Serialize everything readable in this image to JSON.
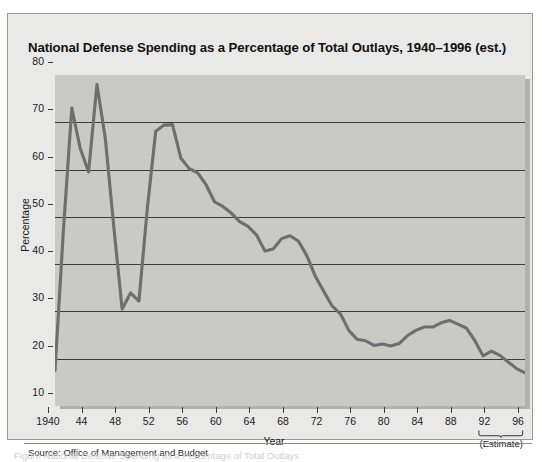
{
  "figure": {
    "title": "National Defense Spending as a Percentage of Total Outlays, 1940–1996 (est.)",
    "source": "Source: Office of Management and Budget",
    "estimate_note": "(Estimate)",
    "caption": "Figure  National Defense Spending as a Percentage of Total Outlays",
    "colors": {
      "page_background": "#ffffff",
      "panel_background": "#e9e9e7",
      "plot_background": "#c9c9c6",
      "plot_shadow": "#b0b0ad",
      "line": "#6e6e6e",
      "gridline": "#3a3a3a",
      "text": "#111111"
    }
  },
  "chart_data": {
    "type": "line",
    "title": "National Defense Spending as a Percentage of Total Outlays, 1940–1996 (est.)",
    "xlabel": "Year",
    "ylabel": "Percentage",
    "xlim": [
      1940,
      1996
    ],
    "ylim": [
      10,
      80
    ],
    "grid": true,
    "legend": null,
    "ytick_labels": [
      "80",
      "70",
      "60",
      "50",
      "40",
      "30",
      "20",
      "10"
    ],
    "ytick_values": [
      80,
      70,
      60,
      50,
      40,
      30,
      20,
      10
    ],
    "xtick_labels": [
      "1940",
      "44",
      "48",
      "52",
      "56",
      "60",
      "64",
      "68",
      "72",
      "76",
      "80",
      "84",
      "88",
      "92",
      "96"
    ],
    "xtick_values": [
      1940,
      1944,
      1948,
      1952,
      1956,
      1960,
      1964,
      1968,
      1972,
      1976,
      1980,
      1984,
      1988,
      1992,
      1996
    ],
    "annotations": [
      {
        "text": "(Estimate)",
        "x_range": [
          1992,
          1996
        ],
        "position": "below-axis"
      }
    ],
    "series": [
      {
        "name": "National defense spending (% of total outlays)",
        "x": [
          1940,
          1941,
          1942,
          1943,
          1944,
          1945,
          1946,
          1947,
          1948,
          1949,
          1950,
          1951,
          1952,
          1953,
          1954,
          1955,
          1956,
          1957,
          1958,
          1959,
          1960,
          1961,
          1962,
          1963,
          1964,
          1965,
          1966,
          1967,
          1968,
          1969,
          1970,
          1971,
          1972,
          1973,
          1974,
          1975,
          1976,
          1977,
          1978,
          1979,
          1980,
          1981,
          1982,
          1983,
          1984,
          1985,
          1986,
          1987,
          1988,
          1989,
          1990,
          1991,
          1992,
          1993,
          1994,
          1995,
          1996
        ],
        "y": [
          17.5,
          47.1,
          73.0,
          64.5,
          59.5,
          78.0,
          66.5,
          48.0,
          30.5,
          33.9,
          32.2,
          51.8,
          68.1,
          69.4,
          69.5,
          62.4,
          60.2,
          59.3,
          56.8,
          53.2,
          52.2,
          50.8,
          49.0,
          48.0,
          46.2,
          42.8,
          43.2,
          45.4,
          46.0,
          44.9,
          41.8,
          37.5,
          34.3,
          31.2,
          29.5,
          26.0,
          24.1,
          23.8,
          22.8,
          23.1,
          22.7,
          23.2,
          24.9,
          26.0,
          26.7,
          26.7,
          27.6,
          28.1,
          27.3,
          26.5,
          23.9,
          20.6,
          21.6,
          20.7,
          19.3,
          17.9,
          17.0
        ],
        "estimate_from": 1992
      }
    ]
  }
}
